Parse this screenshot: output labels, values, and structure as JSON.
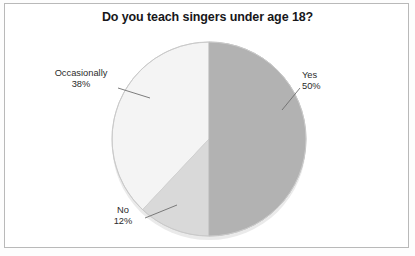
{
  "chart_data": {
    "type": "pie",
    "title": "Do you teach singers under age 18?",
    "categories": [
      "Yes",
      "No",
      "Occasionally"
    ],
    "values": [
      50,
      12,
      38
    ],
    "value_labels": [
      "50%",
      "12%",
      "38%"
    ],
    "units": "percent",
    "legend": "none",
    "labels_position": "outside-with-leader-lines",
    "start_angle_deg": 0,
    "direction": "clockwise",
    "slices": [
      {
        "name": "Yes",
        "value": 50,
        "label": "Yes",
        "pct_text": "50%",
        "color": "#b2b2b2",
        "start_deg": 0,
        "end_deg": 180
      },
      {
        "name": "No",
        "value": 12,
        "label": "No",
        "pct_text": "12%",
        "color": "#d9d9d9",
        "start_deg": 180,
        "end_deg": 223.2
      },
      {
        "name": "Occasionally",
        "value": 38,
        "label": "Occasionally",
        "pct_text": "38%",
        "color": "#f4f4f4",
        "start_deg": 223.2,
        "end_deg": 360
      }
    ],
    "grid": false,
    "xlabel": "",
    "ylabel": ""
  },
  "title": {
    "text": "Do you teach singers under age 18?"
  },
  "labels": {
    "occasionally": {
      "name": "Occasionally",
      "pct": "38%"
    },
    "yes": {
      "name": "Yes",
      "pct": "50%"
    },
    "no": {
      "name": "No",
      "pct": "12%"
    }
  },
  "colors": {
    "yes": "#b2b2b2",
    "no": "#d9d9d9",
    "occasionally": "#f4f4f4",
    "outline": "#c9c9c9",
    "leader": "#6e6e6e",
    "frame": "#b9b9b9",
    "text": "#2b2b2b",
    "title": "#17171a",
    "background": "#ffffff"
  }
}
